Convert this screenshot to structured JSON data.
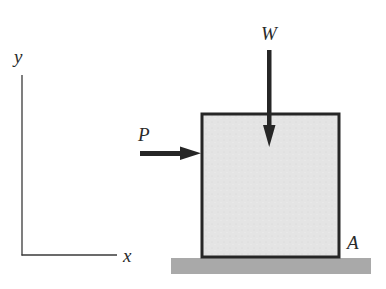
{
  "figure": {
    "type": "free-body diagram",
    "colors": {
      "ink": "#2a2a2a",
      "block_fill": "#e4e4e4",
      "ground_fill": "#a9a9a9",
      "background": "#ffffff"
    }
  },
  "axes": {
    "y_label": "y",
    "x_label": "x"
  },
  "forces": {
    "weight": {
      "label": "W",
      "direction": "down"
    },
    "push": {
      "label": "P",
      "direction": "right"
    }
  },
  "points": {
    "corner": {
      "label": "A"
    }
  }
}
